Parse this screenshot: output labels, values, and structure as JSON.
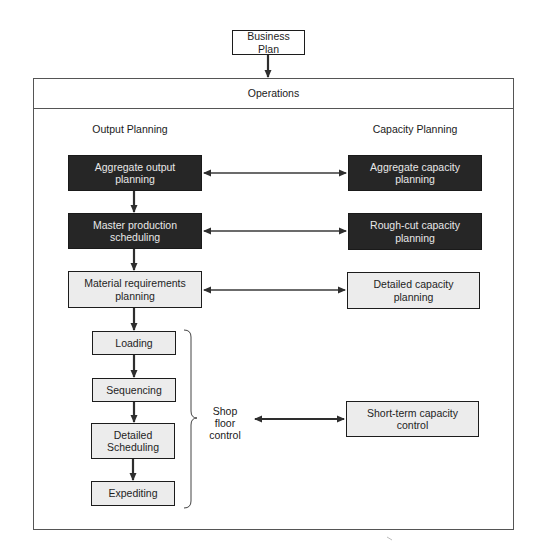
{
  "top": {
    "business_plan": "Business Plan"
  },
  "operations": {
    "title": "Operations"
  },
  "columns": {
    "left": "Output Planning",
    "right": "Capacity Planning"
  },
  "output_planning": [
    {
      "label": "Aggregate output planning",
      "style": "dark"
    },
    {
      "label": "Master production scheduling",
      "style": "dark"
    },
    {
      "label": "Material requirements planning",
      "style": "light"
    }
  ],
  "shop_floor_steps": [
    {
      "label": "Loading"
    },
    {
      "label": "Sequencing"
    },
    {
      "label": "Detailed Scheduling"
    },
    {
      "label": "Expediting"
    }
  ],
  "shop_floor_group": {
    "label": "Shop floor control"
  },
  "capacity_planning": [
    {
      "label": "Aggregate capacity planning",
      "style": "dark"
    },
    {
      "label": "Rough-cut capacity planning",
      "style": "dark"
    },
    {
      "label": "Detailed capacity planning",
      "style": "light"
    },
    {
      "label": "Short-term capacity control",
      "style": "light"
    }
  ],
  "colors": {
    "dark_box": "#262626",
    "light_box": "#ececec",
    "line": "#3a3a3a"
  }
}
